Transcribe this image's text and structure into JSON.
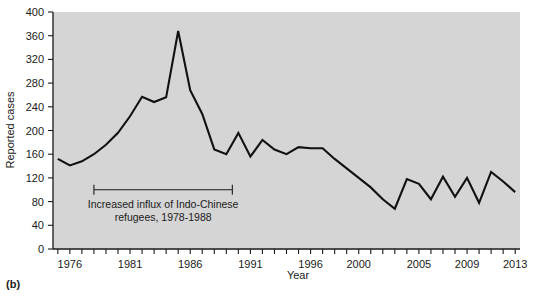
{
  "panel": {
    "label": "(b)"
  },
  "chart_data": {
    "type": "line",
    "title": "",
    "xlabel": "Year",
    "ylabel": "Reported cases",
    "xlim": [
      1974.6,
      2013.4
    ],
    "ylim": [
      0,
      400
    ],
    "grid": false,
    "legend": null,
    "y_ticks": [
      0,
      40,
      80,
      120,
      160,
      200,
      240,
      280,
      320,
      360,
      400
    ],
    "y_tick_labels": [
      "0",
      "40",
      "80",
      "120",
      "160",
      "200",
      "240",
      "280",
      "320",
      "360",
      "400"
    ],
    "x_ticks": [
      1975,
      1976,
      1977,
      1978,
      1979,
      1980,
      1981,
      1982,
      1983,
      1984,
      1985,
      1986,
      1987,
      1988,
      1989,
      1990,
      1991,
      1992,
      1993,
      1994,
      1995,
      1996,
      1997,
      1998,
      1999,
      2000,
      2001,
      2002,
      2003,
      2004,
      2005,
      2006,
      2007,
      2008,
      2009,
      2010,
      2011,
      2012,
      2013
    ],
    "x_tick_labels": [
      {
        "x": 1976,
        "label": "1976"
      },
      {
        "x": 1981,
        "label": "1981"
      },
      {
        "x": 1986,
        "label": "1986"
      },
      {
        "x": 1991,
        "label": "1991"
      },
      {
        "x": 1996,
        "label": "1996"
      },
      {
        "x": 2000,
        "label": "2000"
      },
      {
        "x": 2005,
        "label": "2005"
      },
      {
        "x": 2009,
        "label": "2009"
      },
      {
        "x": 2013,
        "label": "2013"
      }
    ],
    "x": [
      1975,
      1976,
      1977,
      1978,
      1979,
      1980,
      1981,
      1982,
      1983,
      1984,
      1985,
      1986,
      1987,
      1988,
      1989,
      1990,
      1991,
      1992,
      1993,
      1994,
      1995,
      1996,
      1997,
      1998,
      1999,
      2000,
      2001,
      2002,
      2003,
      2004,
      2005,
      2006,
      2007,
      2008,
      2009,
      2010,
      2011,
      2012,
      2013
    ],
    "values": [
      152,
      141,
      148,
      160,
      176,
      196,
      224,
      257,
      248,
      256,
      368,
      268,
      228,
      168,
      160,
      196,
      156,
      184,
      168,
      160,
      172,
      170,
      170,
      152,
      136,
      120,
      104,
      84,
      68,
      118,
      110,
      84,
      122,
      88,
      120,
      78,
      130,
      114,
      96
    ],
    "annotations": [
      {
        "type": "bracket",
        "x_start": 1978,
        "x_end": 1989.5,
        "y": 100,
        "text_line1": "Increased influx of Indo-Chinese",
        "text_line2": "refugees, 1978-1988"
      }
    ],
    "colors": {
      "plot_background": "#d5d5d5",
      "page_background": "#ffffff",
      "line": "#111111",
      "axis": "#1a1a1a",
      "text": "#1a1a1a"
    }
  }
}
